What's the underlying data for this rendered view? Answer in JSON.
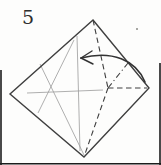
{
  "step": {
    "label": "5"
  },
  "colors": {
    "background": "#fdfdfc",
    "outline": "#3f3f3f",
    "crease": "#9b9b9b",
    "fold": "#3f3f3f",
    "arrow": "#333333",
    "frame_border": "#1c1c1c",
    "speck": "#8a8a86"
  },
  "diagram": {
    "type": "origami-step",
    "paper_outline": {
      "shape": "diamond",
      "points": [
        [
          93,
          20
        ],
        [
          149,
          88
        ],
        [
          84,
          157
        ],
        [
          10,
          94
        ]
      ]
    },
    "creases": [
      {
        "name": "vertical-crease",
        "from": [
          77,
          36
        ],
        "to": [
          80,
          151
        ]
      },
      {
        "name": "horizontal-crease",
        "from": [
          27,
          93
        ],
        "to": [
          103,
          90
        ]
      },
      {
        "name": "diagonal-crease-ne-sw",
        "from": [
          74,
          40
        ],
        "to": [
          38,
          113
        ]
      },
      {
        "name": "diagonal-crease-nw-se",
        "from": [
          40,
          64
        ],
        "to": [
          84,
          155
        ]
      }
    ],
    "valley_folds": [
      {
        "name": "valley-fold-top",
        "from": [
          93,
          20
        ],
        "to": [
          108,
          88
        ]
      },
      {
        "name": "valley-fold-right",
        "from": [
          108,
          88
        ],
        "to": [
          147,
          88
        ]
      },
      {
        "name": "valley-fold-bottom",
        "from": [
          108,
          88
        ],
        "to": [
          85,
          154
        ]
      }
    ],
    "mountain_folds": [
      {
        "name": "mountain-fold-upper-right",
        "from": [
          108,
          88
        ],
        "to": [
          128,
          63
        ]
      }
    ],
    "fold_arrow": {
      "name": "fold-arrow",
      "path": "M145,82 C136,60 112,50 81,58",
      "tip": [
        81,
        58
      ],
      "barbs": [
        [
          92,
          51
        ],
        [
          93,
          64
        ]
      ]
    },
    "frame_borders": [
      {
        "name": "frame-left",
        "from": [
          1,
          70
        ],
        "to": [
          1,
          165
        ]
      },
      {
        "name": "frame-bottom",
        "from": [
          0,
          163.8
        ],
        "to": [
          161,
          163.8
        ]
      },
      {
        "name": "frame-right",
        "from": [
          160,
          63
        ],
        "to": [
          160,
          165
        ]
      }
    ],
    "speck": [
      137,
      29
    ]
  }
}
